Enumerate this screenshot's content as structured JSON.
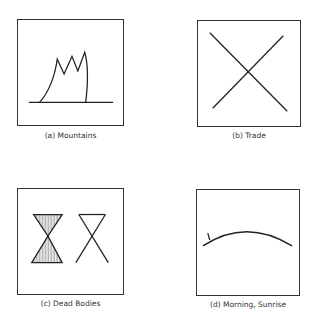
{
  "figure": {
    "panels": [
      {
        "id": "a",
        "caption": "(a) Mountains",
        "symbol": "mountains-glyph"
      },
      {
        "id": "b",
        "caption": "(b) Trade",
        "symbol": "trade-cross-glyph"
      },
      {
        "id": "c",
        "caption": "(c) Dead Bodies",
        "symbol": "dead-bodies-hourglass-glyph"
      },
      {
        "id": "d",
        "caption": "(d) Morning, Sunrise",
        "symbol": "sunrise-arc-glyph"
      }
    ],
    "line_color": "#222222"
  }
}
